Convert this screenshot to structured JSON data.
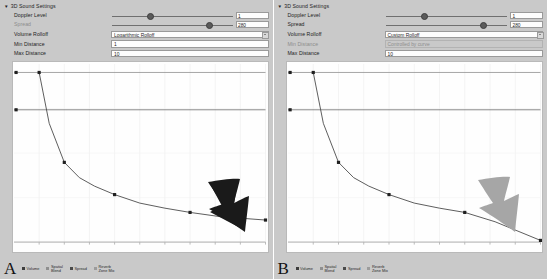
{
  "panels": [
    {
      "tag": "A",
      "inspector": {
        "section_title": "3D Sound Settings",
        "foldout_icon": "triangle-down-icon",
        "rows": [
          {
            "label": "Doppler Level",
            "control": "slider",
            "value": "1",
            "knob_pct": 29,
            "dim": false
          },
          {
            "label": "Spread",
            "control": "slider",
            "value": "280",
            "knob_pct": 78,
            "dim": true
          },
          {
            "label": "Volume Rolloff",
            "control": "dropdown",
            "value": "Logarithmic Rolloff",
            "dim": false
          },
          {
            "label": "Min Distance",
            "control": "field",
            "value": "1",
            "dim": false,
            "readonly": false
          },
          {
            "label": "Max Distance",
            "control": "field",
            "value": "10",
            "dim": false,
            "readonly": false
          }
        ]
      },
      "legend": [
        {
          "label": "Volume",
          "swatch": "sw-vol"
        },
        {
          "label": "Spatial\nBlend",
          "swatch": "sw-blend"
        },
        {
          "label": "Spread",
          "swatch": "sw-spread"
        },
        {
          "label": "Reverb\nZone Mix",
          "swatch": "sw-reverb"
        }
      ],
      "arrow": {
        "name": "black-arrow-annotation",
        "color": "#1a1a1a"
      }
    },
    {
      "tag": "B",
      "inspector": {
        "section_title": "3D Sound Settings",
        "foldout_icon": "triangle-down-icon",
        "rows": [
          {
            "label": "Doppler Level",
            "control": "slider",
            "value": "1",
            "knob_pct": 29,
            "dim": false
          },
          {
            "label": "Spread",
            "control": "slider",
            "value": "280",
            "knob_pct": 78,
            "dim": true
          },
          {
            "label": "Volume Rolloff",
            "control": "dropdown",
            "value": "Custom Rolloff",
            "dim": false
          },
          {
            "label": "Min Distance",
            "control": "field",
            "value": "Controlled by curve",
            "dim": true,
            "readonly": true
          },
          {
            "label": "Max Distance",
            "control": "field",
            "value": "10",
            "dim": false,
            "readonly": false
          }
        ]
      },
      "legend": [
        {
          "label": "Volume",
          "swatch": "sw-vol"
        },
        {
          "label": "Spatial\nBlend",
          "swatch": "sw-blend"
        },
        {
          "label": "Spread",
          "swatch": "sw-spread"
        },
        {
          "label": "Reverb\nZone Mix",
          "swatch": "sw-reverb"
        }
      ],
      "arrow": {
        "name": "gray-arrow-annotation",
        "color": "#a6a6a6"
      }
    }
  ],
  "chart_data": [
    {
      "type": "line",
      "title": "Logarithmic Rolloff volume curve",
      "xlabel": "Distance",
      "ylabel": "Volume",
      "xlim": [
        0,
        10
      ],
      "ylim": [
        0,
        1.05
      ],
      "grid": true,
      "legend_position": "below-plot",
      "yticks": [
        "1.10",
        "1.00",
        "0.95",
        "0.90",
        "0.85",
        "0.80",
        "0.75",
        "0.70",
        "0.65",
        "0.60",
        "0.55",
        "0.50",
        "0.45",
        "0.40",
        "0.35",
        "0.30",
        "0.25",
        "0.20",
        "0.15",
        "0.10",
        "0.05",
        "0.00"
      ],
      "xticks": [
        "1",
        "2",
        "3",
        "4",
        "5",
        "6",
        "7",
        "8",
        "9",
        "10"
      ],
      "series": [
        {
          "name": "Volume",
          "keys": [
            1,
            2,
            4,
            7,
            10
          ],
          "x": [
            1,
            1.4,
            2,
            2.6,
            3.2,
            4,
            5,
            6,
            7,
            8.2,
            10
          ],
          "values": [
            1.0,
            0.7,
            0.47,
            0.38,
            0.33,
            0.28,
            0.23,
            0.2,
            0.175,
            0.15,
            0.13
          ]
        },
        {
          "name": "Spatial Blend",
          "constant": 1.0
        },
        {
          "name": "Spread",
          "constant": 0.78
        },
        {
          "name": "Reverb Zone Mix",
          "constant": 0.0
        }
      ]
    },
    {
      "type": "line",
      "title": "Custom Rolloff volume curve",
      "xlabel": "Distance",
      "ylabel": "Volume",
      "xlim": [
        0,
        10
      ],
      "ylim": [
        0,
        1.05
      ],
      "grid": true,
      "legend_position": "below-plot",
      "yticks": [
        "1.10",
        "1.00",
        "0.95",
        "0.90",
        "0.85",
        "0.80",
        "0.75",
        "0.70",
        "0.65",
        "0.60",
        "0.55",
        "0.50",
        "0.45",
        "0.40",
        "0.35",
        "0.30",
        "0.25",
        "0.20",
        "0.15",
        "0.10",
        "0.05",
        "0.00"
      ],
      "xticks": [
        "1",
        "2",
        "3",
        "4",
        "5",
        "6",
        "7",
        "8",
        "9",
        "10"
      ],
      "series": [
        {
          "name": "Volume",
          "keys": [
            1,
            2,
            4,
            7,
            10
          ],
          "x": [
            1,
            1.4,
            2,
            2.6,
            3.2,
            4,
            5,
            6,
            7,
            8.2,
            10
          ],
          "values": [
            1.0,
            0.7,
            0.47,
            0.38,
            0.33,
            0.28,
            0.23,
            0.2,
            0.175,
            0.12,
            0.01
          ]
        },
        {
          "name": "Spatial Blend",
          "constant": 1.0
        },
        {
          "name": "Spread",
          "constant": 0.78
        },
        {
          "name": "Reverb Zone Mix",
          "constant": 0.0
        }
      ]
    }
  ]
}
